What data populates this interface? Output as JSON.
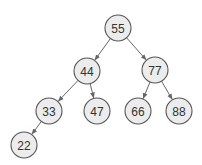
{
  "diagram": {
    "type": "binary-tree",
    "nodes": [
      {
        "id": "n55",
        "label": "55",
        "x": 118,
        "y": 28
      },
      {
        "id": "n44",
        "label": "44",
        "x": 87,
        "y": 71
      },
      {
        "id": "n77",
        "label": "77",
        "x": 155,
        "y": 70
      },
      {
        "id": "n33",
        "label": "33",
        "x": 49,
        "y": 111
      },
      {
        "id": "n47",
        "label": "47",
        "x": 97,
        "y": 111
      },
      {
        "id": "n66",
        "label": "66",
        "x": 138,
        "y": 111
      },
      {
        "id": "n88",
        "label": "88",
        "x": 179,
        "y": 111
      },
      {
        "id": "n22",
        "label": "22",
        "x": 24,
        "y": 145
      }
    ],
    "edges": [
      {
        "from": "n55",
        "to": "n44"
      },
      {
        "from": "n55",
        "to": "n77"
      },
      {
        "from": "n44",
        "to": "n33"
      },
      {
        "from": "n44",
        "to": "n47"
      },
      {
        "from": "n77",
        "to": "n66"
      },
      {
        "from": "n77",
        "to": "n88"
      },
      {
        "from": "n33",
        "to": "n22"
      }
    ],
    "node_radius": 13,
    "colors": {
      "node_fill": "#ececec",
      "node_stroke": "#555555",
      "edge": "#666666",
      "text": "#333333"
    }
  }
}
